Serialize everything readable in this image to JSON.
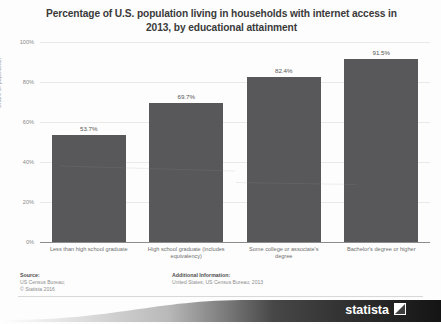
{
  "chart_data": {
    "type": "bar",
    "title": "Percentage of U.S. population living in households with internet access in 2013, by educational attainment",
    "xlabel": "",
    "ylabel": "Share of population",
    "ylim": [
      0,
      100
    ],
    "grid": true,
    "legend": "none",
    "categories": [
      "Less than high school graduate",
      "High school graduate (includes equivalency)",
      "Some college or associate's degree",
      "Bachelor's degree or higher"
    ],
    "values": [
      53.7,
      69.7,
      82.4,
      91.5
    ],
    "value_labels": [
      "53.7%",
      "69.7%",
      "82.4%",
      "91.5%"
    ],
    "y_ticks": [
      0,
      20,
      40,
      60,
      80,
      100
    ],
    "y_tick_labels": [
      "0%",
      "20%",
      "40%",
      "60%",
      "80%",
      "100%"
    ],
    "bar_color": "#58585a"
  },
  "footer": {
    "source_heading": "Source:",
    "source_lines": [
      "US Census Bureau;",
      "© Statista 2016"
    ],
    "additional_heading": "Additional Information:",
    "additional_lines": [
      "United States; US Census Bureau; 2013"
    ],
    "logo_text": "statista"
  }
}
